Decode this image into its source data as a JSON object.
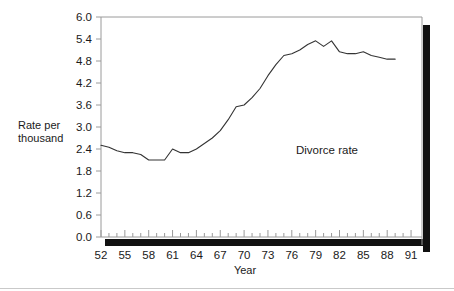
{
  "chart_data": {
    "type": "line",
    "title": "",
    "xlabel": "Year",
    "ylabel": "Rate per thousand",
    "ylabel_line1": "Rate per",
    "ylabel_line2": "thousand",
    "series_label": "Divorce rate",
    "grid": false,
    "legend_position": "inline-annotation",
    "xlim": [
      52,
      92
    ],
    "ylim": [
      0.0,
      6.0
    ],
    "x_tick_labels": [
      "52",
      "55",
      "58",
      "61",
      "64",
      "67",
      "70",
      "73",
      "76",
      "79",
      "82",
      "85",
      "88",
      "91"
    ],
    "x_tick_values": [
      52,
      55,
      58,
      61,
      64,
      67,
      70,
      73,
      76,
      79,
      82,
      85,
      88,
      91
    ],
    "x_minor_tick_values": [
      52,
      53,
      54,
      55,
      56,
      57,
      58,
      59,
      60,
      61,
      62,
      63,
      64,
      65,
      66,
      67,
      68,
      69,
      70,
      71,
      72,
      73,
      74,
      75,
      76,
      77,
      78,
      79,
      80,
      81,
      82,
      83,
      84,
      85,
      86,
      87,
      88,
      89,
      90,
      91
    ],
    "y_tick_labels": [
      "0.0",
      "0.6",
      "1.2",
      "1.8",
      "2.4",
      "3.0",
      "3.6",
      "4.2",
      "4.8",
      "5.4",
      "6.0"
    ],
    "y_tick_values": [
      0.0,
      0.6,
      1.2,
      1.8,
      2.4,
      3.0,
      3.6,
      4.2,
      4.8,
      5.4,
      6.0
    ],
    "x": [
      52,
      53,
      54,
      55,
      56,
      57,
      58,
      59,
      60,
      61,
      62,
      63,
      64,
      65,
      66,
      67,
      68,
      69,
      70,
      71,
      72,
      73,
      74,
      75,
      76,
      77,
      78,
      79,
      80,
      81,
      82,
      83,
      84,
      85,
      86,
      87,
      88,
      89
    ],
    "values": [
      2.5,
      2.45,
      2.35,
      2.3,
      2.3,
      2.25,
      2.1,
      2.1,
      2.1,
      2.4,
      2.3,
      2.3,
      2.4,
      2.55,
      2.7,
      2.9,
      3.2,
      3.55,
      3.6,
      3.8,
      4.05,
      4.4,
      4.7,
      4.95,
      5.0,
      5.1,
      5.25,
      5.35,
      5.2,
      5.35,
      5.05,
      5.0,
      5.0,
      5.05,
      4.95,
      4.9,
      4.85,
      4.85
    ],
    "line_color": "#333333",
    "axis_color": "#9a9a9a",
    "shadow_color": "#111111"
  },
  "axis": {
    "x_title": "Year",
    "y_title_line1": "Rate per",
    "y_title_line2": "thousand"
  },
  "annotations": {
    "series_name": "Divorce rate"
  }
}
